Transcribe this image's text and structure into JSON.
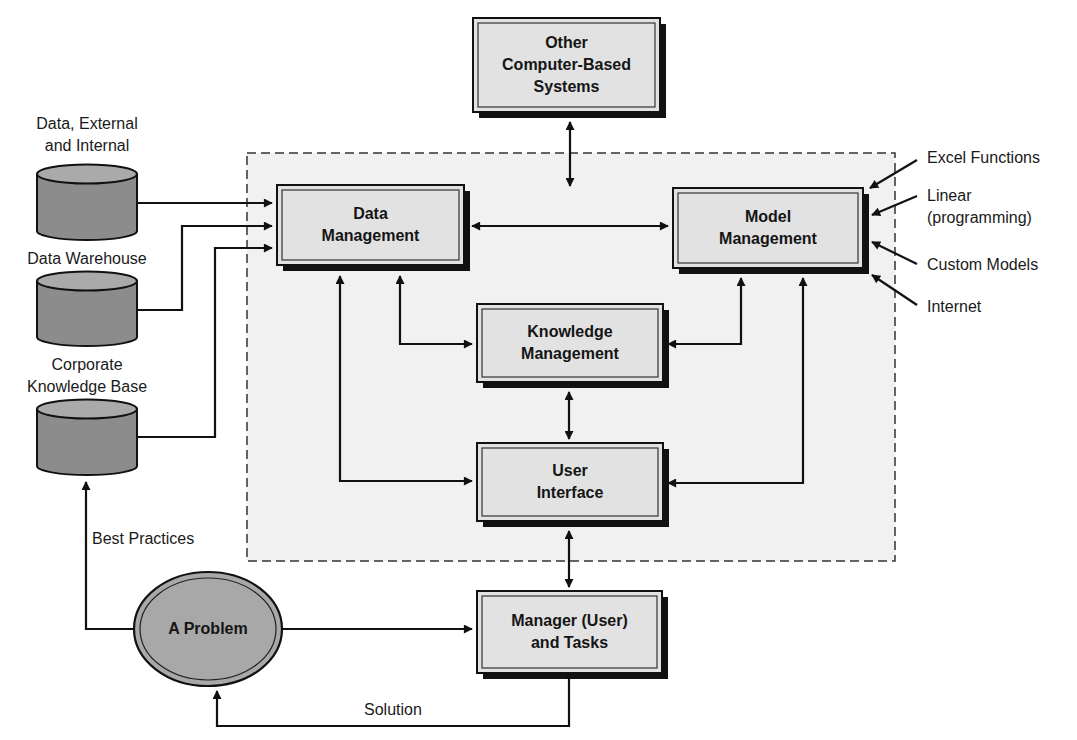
{
  "diagram": {
    "type": "DSS architecture diagram",
    "colors": {
      "background": "#ffffff",
      "subsystem_region_fill": "#f1f1f1",
      "box_fill": "#e2e2e2",
      "box_border": "#111111",
      "database_body": "#8c8c8c",
      "database_top": "#aaaaaa",
      "ellipse_fill": "#a8a8a8",
      "line": "#111111"
    },
    "boxes": {
      "other_systems": {
        "lines": [
          "Other",
          "Computer-Based",
          "Systems"
        ]
      },
      "data_management": {
        "lines": [
          "Data",
          "Management"
        ]
      },
      "model_management": {
        "lines": [
          "Model",
          "Management"
        ]
      },
      "knowledge_management": {
        "lines": [
          "Knowledge",
          "Management"
        ]
      },
      "user_interface": {
        "lines": [
          "User",
          "Interface"
        ]
      },
      "manager": {
        "lines": [
          "Manager (User)",
          "and Tasks"
        ]
      }
    },
    "problem": {
      "label": "A Problem"
    },
    "databases": [
      {
        "lines": [
          "Data, External",
          "and Internal"
        ]
      },
      {
        "lines": [
          "Data Warehouse"
        ]
      },
      {
        "lines": [
          "Corporate",
          "Knowledge Base"
        ]
      }
    ],
    "model_inputs": [
      {
        "lines": [
          "Excel Functions"
        ]
      },
      {
        "lines": [
          "Linear",
          "(programming)"
        ]
      },
      {
        "lines": [
          "Custom Models"
        ]
      },
      {
        "lines": [
          "Internet"
        ]
      }
    ],
    "edge_labels": {
      "best_practices": "Best Practices",
      "solution": "Solution"
    }
  }
}
